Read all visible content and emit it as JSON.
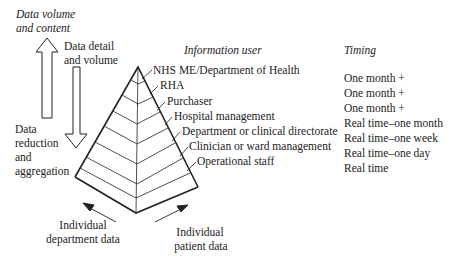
{
  "left_annotations": {
    "data_volume_content": [
      "Data volume",
      "and content"
    ],
    "data_detail_volume": [
      "Data detail",
      "and volume"
    ],
    "data_reduction": [
      "Data",
      "reduction",
      "and",
      "aggregation"
    ]
  },
  "column_headers": {
    "information_user": "Information user",
    "timing": "Timing"
  },
  "levels": [
    {
      "user": "NHS ME/Department of Health",
      "timing": "One month +"
    },
    {
      "user": "RHA",
      "timing": "One month +"
    },
    {
      "user": "Purchaser",
      "timing": "One month +"
    },
    {
      "user": "Hospital management",
      "timing": "Real time–one month"
    },
    {
      "user": "Department or clinical directorate",
      "timing": "Real time–one week"
    },
    {
      "user": "Clinician or ward management",
      "timing": "Real time–one day"
    },
    {
      "user": "Operational staff",
      "timing": "Real time"
    }
  ],
  "bottom_labels": {
    "department": [
      "Individual",
      "department data"
    ],
    "patient": [
      "Individual",
      "patient data"
    ]
  },
  "colors": {
    "line": "#222222",
    "text": "#222222",
    "background": "#ffffff"
  }
}
